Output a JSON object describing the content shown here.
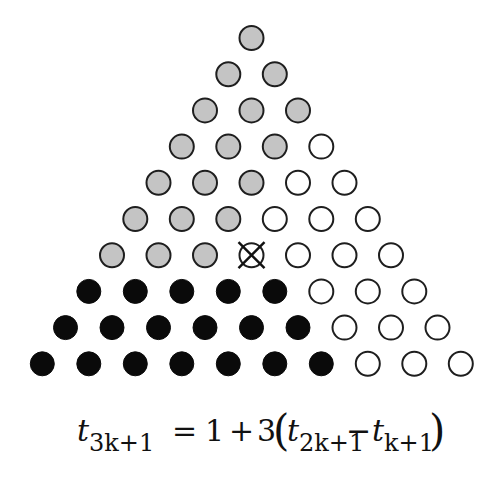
{
  "diagram": {
    "rows": [
      [
        "gray"
      ],
      [
        "gray",
        "gray"
      ],
      [
        "gray",
        "gray",
        "gray"
      ],
      [
        "gray",
        "gray",
        "gray",
        "white"
      ],
      [
        "gray",
        "gray",
        "gray",
        "white",
        "white"
      ],
      [
        "gray",
        "gray",
        "gray",
        "white",
        "white",
        "white"
      ],
      [
        "gray",
        "gray",
        "gray",
        "cross",
        "white",
        "white",
        "white"
      ],
      [
        "black",
        "black",
        "black",
        "black",
        "black",
        "white",
        "white",
        "white"
      ],
      [
        "black",
        "black",
        "black",
        "black",
        "black",
        "black",
        "white",
        "white",
        "white"
      ],
      [
        "black",
        "black",
        "black",
        "black",
        "black",
        "black",
        "black",
        "white",
        "white",
        "white"
      ]
    ],
    "colors": {
      "gray": "#c4c4c4",
      "black": "#0a0a0a",
      "white": "#ffffff",
      "stroke": "#1e1e1e"
    },
    "layout": {
      "top_y": 38,
      "row_step": 36.2,
      "center_x": 251.5,
      "col_step": 46.5,
      "radius": 12
    }
  },
  "formula": {
    "lhs_base": "t",
    "lhs_sub": "3k+1",
    "equals": "=",
    "one": "1",
    "plus": "+",
    "three": "3",
    "open_paren": "(",
    "t1_base": "t",
    "t1_sub": "2k+1",
    "minus": "−",
    "t2_base": "t",
    "t2_sub": "k+1",
    "close_paren": ")"
  }
}
